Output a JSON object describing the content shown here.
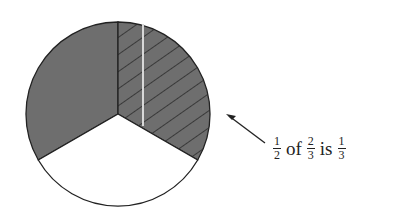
{
  "diagram": {
    "type": "fraction-pie",
    "slices": 3,
    "shaded_slices": 2,
    "hatched_slices": 1,
    "colors": {
      "shaded": "#6e6e6e",
      "unshaded": "#ffffff",
      "outline": "#222222",
      "hatch": "#222222"
    }
  },
  "annotation": {
    "frac1": {
      "num": "1",
      "den": "2"
    },
    "of": "of",
    "frac2": {
      "num": "2",
      "den": "3"
    },
    "is": "is",
    "frac3": {
      "num": "1",
      "den": "3"
    }
  }
}
